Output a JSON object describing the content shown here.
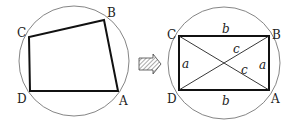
{
  "left_figure": {
    "description": "Cyclic quadrilateral ABCD inscribed in circle",
    "circle": {
      "cx": 74,
      "cy": 60,
      "r": 55
    },
    "vertices": {
      "A": {
        "label": "A",
        "x": 118,
        "y": 91
      },
      "B": {
        "label": "B",
        "x": 104,
        "y": 20
      },
      "C": {
        "label": "C",
        "x": 29,
        "y": 37
      },
      "D": {
        "label": "D",
        "x": 30,
        "y": 91
      }
    }
  },
  "arrow": {
    "description": "hatched right arrow",
    "icon": "right-arrow-icon"
  },
  "right_figure": {
    "description": "Rectangle ABCD inscribed in circle with diagonals",
    "circle": {
      "cx": 224,
      "cy": 62,
      "r": 57
    },
    "vertices": {
      "A": {
        "label": "A",
        "x": 269,
        "y": 90
      },
      "B": {
        "label": "B",
        "x": 269,
        "y": 36
      },
      "C": {
        "label": "C",
        "x": 179,
        "y": 36
      },
      "D": {
        "label": "D",
        "x": 179,
        "y": 90
      }
    },
    "side_labels": {
      "top": "b",
      "bottom": "b",
      "left": "a",
      "right": "a",
      "diag1": "c",
      "diag2": "c"
    }
  }
}
